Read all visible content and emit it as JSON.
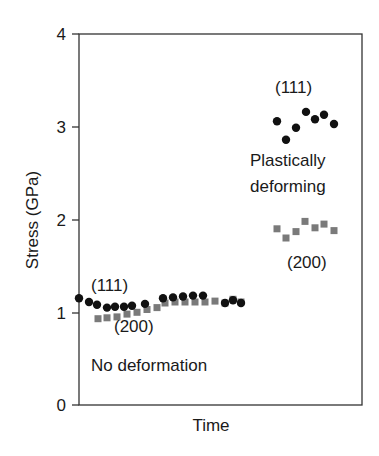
{
  "chart_data": {
    "type": "scatter",
    "title": "",
    "xlabel": "Time",
    "ylabel": "Stress (GPa)",
    "ylim": [
      0,
      4
    ],
    "yticks": [
      "0",
      "1",
      "2",
      "3",
      "4"
    ],
    "xticks": [],
    "grid": false,
    "legend": null,
    "annotations": [
      {
        "text": "(111)",
        "region": "no-deformation",
        "refers_to": "(111) circles"
      },
      {
        "text": "(200)",
        "region": "no-deformation",
        "refers_to": "(200) squares"
      },
      {
        "text": "No deformation",
        "region": "left"
      },
      {
        "text": "(111)",
        "region": "plastically-deforming",
        "refers_to": "(111) circles"
      },
      {
        "text": "Plastically",
        "region": "right"
      },
      {
        "text": "deforming",
        "region": "right"
      },
      {
        "text": "(200)",
        "region": "plastically-deforming",
        "refers_to": "(200) squares"
      }
    ],
    "series": [
      {
        "name": "(111) no deformation",
        "marker": "circle",
        "color": "#111111",
        "x": [
          79,
          89,
          97,
          107,
          115,
          124,
          132,
          145,
          163,
          173,
          183,
          193,
          203,
          225,
          233,
          241
        ],
        "values": [
          1.15,
          1.11,
          1.08,
          1.05,
          1.06,
          1.06,
          1.07,
          1.09,
          1.15,
          1.16,
          1.17,
          1.18,
          1.18,
          1.1,
          1.13,
          1.1
        ]
      },
      {
        "name": "(200) no deformation",
        "marker": "square",
        "color": "#7a7a7a",
        "x": [
          98,
          107,
          117,
          127,
          137,
          147,
          157,
          165,
          175,
          185,
          195,
          205,
          215,
          225,
          233,
          241
        ],
        "values": [
          0.93,
          0.94,
          0.95,
          0.98,
          1.0,
          1.03,
          1.05,
          1.1,
          1.11,
          1.11,
          1.11,
          1.11,
          1.12,
          1.1,
          1.14,
          1.11
        ]
      },
      {
        "name": "(111) plastically deforming",
        "marker": "circle",
        "color": "#111111",
        "x": [
          277,
          286,
          296,
          306,
          315,
          324,
          334
        ],
        "values": [
          3.06,
          2.86,
          2.99,
          3.16,
          3.08,
          3.13,
          3.03
        ]
      },
      {
        "name": "(200) plastically deforming",
        "marker": "square",
        "color": "#7a7a7a",
        "x": [
          277,
          286,
          296,
          305,
          315,
          324,
          334
        ],
        "values": [
          1.9,
          1.8,
          1.87,
          1.98,
          1.91,
          1.95,
          1.88
        ]
      }
    ]
  },
  "labels": {
    "ylabel": "Stress (GPa)",
    "xlabel": "Time",
    "left_111": "(111)",
    "left_200": "(200)",
    "no_deformation": "No deformation",
    "right_111": "(111)",
    "plastically": "Plastically",
    "deforming": "deforming",
    "right_200": "(200)",
    "tick_0": "0",
    "tick_1": "1",
    "tick_2": "2",
    "tick_3": "3",
    "tick_4": "4"
  }
}
